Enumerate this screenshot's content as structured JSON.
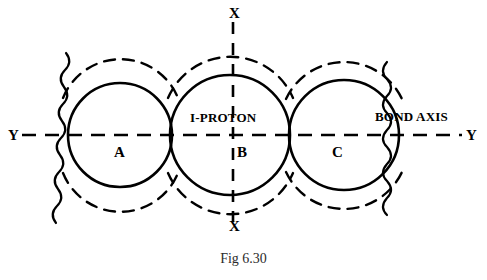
{
  "figure": {
    "caption": "Fig 6.30",
    "axis_labels": {
      "x_top": "X",
      "x_bottom": "X",
      "y_left": "Y",
      "y_right": "Y"
    },
    "annotations": {
      "proton": "I-PROTON",
      "bond_axis": "BOND AXIS"
    },
    "orbitals": [
      {
        "id": "A",
        "label": "A",
        "cx": 120,
        "cy": 135,
        "r": 52,
        "halo_r": 62
      },
      {
        "id": "B",
        "label": "B",
        "cx": 230,
        "cy": 135,
        "r": 60,
        "halo_r": 68
      },
      {
        "id": "C",
        "label": "C",
        "cx": 344,
        "cy": 135,
        "r": 55,
        "halo_r": 64
      }
    ],
    "axes": {
      "horizontal": {
        "y": 135,
        "x1": 22,
        "x2": 462,
        "style": "dashed"
      },
      "vertical": {
        "x": 233,
        "y1": 22,
        "y2": 222,
        "style": "dashed"
      }
    },
    "colors": {
      "ink": "#000000",
      "caption": "#2b2b2b",
      "background": "#ffffff"
    }
  }
}
